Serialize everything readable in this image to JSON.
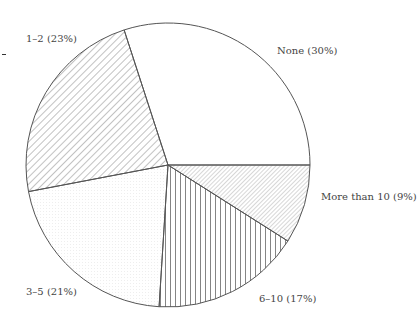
{
  "chart_data": {
    "type": "pie",
    "title": "",
    "start_angle_deg": -108,
    "direction": "clockwise",
    "slices": [
      {
        "label": "None (30%)",
        "category": "None",
        "value": 30,
        "pattern": "none"
      },
      {
        "label": "More than 10 (9%)",
        "category": "More than 10",
        "value": 9,
        "pattern": "fine-diagonal"
      },
      {
        "label": "6–10 (17%)",
        "category": "6–10",
        "value": 17,
        "pattern": "vertical-lines"
      },
      {
        "label": "3–5 (21%)",
        "category": "3–5",
        "value": 21,
        "pattern": "dots"
      },
      {
        "label": "1–2 (23%)",
        "category": "1–2",
        "value": 23,
        "pattern": "diagonal"
      }
    ],
    "colors": {
      "stroke": "#555555",
      "hatch": "#666666",
      "text": "#444444"
    }
  }
}
